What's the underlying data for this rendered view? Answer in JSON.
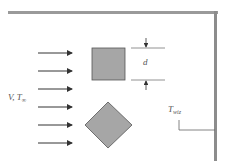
{
  "diagram": {
    "flow_label": {
      "main": "V, T",
      "sub": "∞"
    },
    "dimension_label": "d",
    "wall_label": {
      "main": "T",
      "sub": "wiz"
    },
    "arrow_count": 6,
    "colors": {
      "shape_fill": "#a6a6a6",
      "shape_stroke": "#555555",
      "wall": "#8c8c8c",
      "arrow": "#333333",
      "background": "#ffffff"
    },
    "shapes": [
      "square",
      "diamond"
    ]
  }
}
